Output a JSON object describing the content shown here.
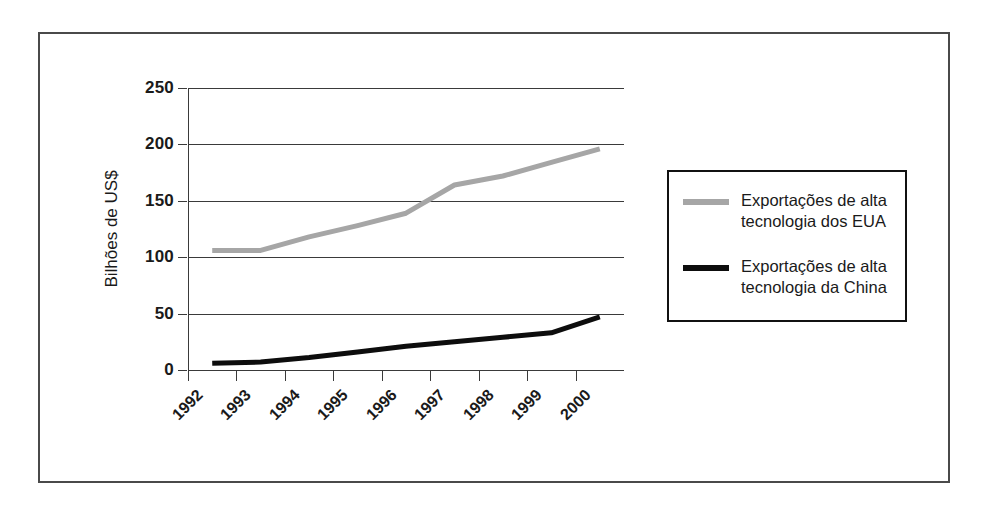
{
  "chart_data": {
    "type": "line",
    "title": "",
    "xlabel": "",
    "ylabel": "Bilhões de US$",
    "categories": [
      "1992",
      "1993",
      "1994",
      "1995",
      "1996",
      "1997",
      "1998",
      "1999",
      "2000"
    ],
    "xtick_labels": [
      "1992",
      "1993",
      "1994",
      "1995",
      "1996",
      "1997",
      "1998",
      "1999",
      "2000"
    ],
    "ytick_labels": [
      "0",
      "50",
      "100",
      "150",
      "200",
      "250"
    ],
    "yticks": [
      0,
      50,
      100,
      150,
      200,
      250
    ],
    "ylim": [
      0,
      250
    ],
    "grid": "horizontal",
    "legend_position": "right-outside",
    "series": [
      {
        "name": "Exportações de alta tecnologia dos EUA",
        "color": "#a6a6a6",
        "values": [
          106,
          106,
          118,
          128,
          139,
          164,
          172,
          184,
          196
        ]
      },
      {
        "name": "Exportações de alta tecnologia da China",
        "color": "#0d0d0d",
        "values": [
          6,
          7,
          11,
          16,
          21,
          25,
          29,
          33,
          47
        ]
      }
    ]
  },
  "legend": {
    "entries": [
      {
        "label": "Exportações de alta\ntecnologia dos EUA",
        "swatch": "eua"
      },
      {
        "label": "Exportações de alta\ntecnologia da China",
        "swatch": "china"
      }
    ]
  }
}
